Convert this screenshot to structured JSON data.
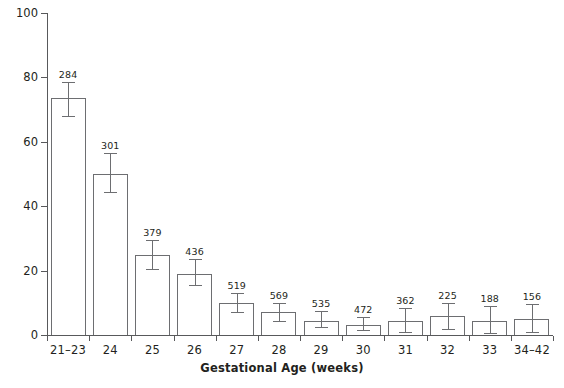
{
  "chart_data": {
    "type": "bar",
    "title": "",
    "subtitle": "",
    "xlabel": "Gestational Age (weeks)",
    "ylabel": "% Died",
    "ylim": [
      0,
      100
    ],
    "yticks": [
      0,
      20,
      40,
      60,
      80,
      100
    ],
    "ytick_labels": [
      "0",
      "20",
      "40",
      "60",
      "80",
      "100"
    ],
    "grid": false,
    "legend": null,
    "legend_position": "none",
    "categories": [
      "21–23",
      "24",
      "25",
      "26",
      "27",
      "28",
      "29",
      "30",
      "31",
      "32",
      "33",
      "34–42"
    ],
    "values": [
      73.5,
      50.0,
      25.0,
      19.0,
      10.0,
      7.0,
      4.5,
      3.0,
      4.5,
      6.0,
      4.5,
      5.0
    ],
    "error_low": [
      68.0,
      44.5,
      20.5,
      15.5,
      7.0,
      4.5,
      2.5,
      1.5,
      1.0,
      2.0,
      0.5,
      1.0
    ],
    "error_high": [
      78.5,
      56.5,
      29.5,
      23.5,
      13.0,
      10.0,
      7.5,
      5.5,
      8.5,
      10.0,
      9.0,
      9.5
    ],
    "point_labels": [
      "284",
      "301",
      "379",
      "436",
      "519",
      "569",
      "535",
      "472",
      "362",
      "225",
      "188",
      "156"
    ],
    "point_label_meaning": "n",
    "bar_fill": "#ffffff",
    "bar_edge": "#6d6e71",
    "axis_color": "#58595b",
    "text_color": "#231f20"
  }
}
